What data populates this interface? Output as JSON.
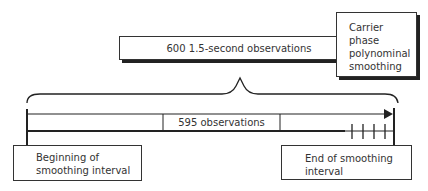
{
  "diagram": {
    "top_box": {
      "label": "600 1.5-second observations"
    },
    "side_box": {
      "lines": [
        "Carrier phase",
        "polynominal",
        "smoothing"
      ]
    },
    "inner_box": {
      "label": "595 observations"
    },
    "start_box": {
      "lines": [
        "Beginning of",
        "smoothing interval"
      ]
    },
    "end_box": {
      "lines": [
        "End of smoothing",
        "interval"
      ]
    },
    "tick_count": 4,
    "colors": {
      "line": "#222222",
      "box_border": "#333333",
      "background": "#ffffff"
    }
  }
}
